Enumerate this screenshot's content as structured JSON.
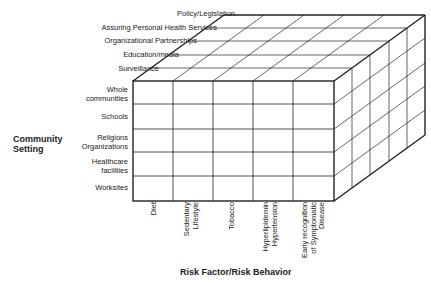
{
  "diagram": {
    "depth_axis": {
      "items": [
        "Policy/Legislation",
        "Assuring Personal Health Services",
        "Organizational Partnerships",
        "Education/media",
        "Surveillance"
      ]
    },
    "vertical_axis": {
      "title_line1": "Community",
      "title_line2": "Setting",
      "items": [
        {
          "line1": "Whole",
          "line2": "communities"
        },
        {
          "line1": "Schools",
          "line2": ""
        },
        {
          "line1": "Religions",
          "line2": "Organizations"
        },
        {
          "line1": "Healthcare",
          "line2": "facilities"
        },
        {
          "line1": "Worksites",
          "line2": ""
        }
      ]
    },
    "horizontal_axis": {
      "title": "Risk Factor/Risk Behavior",
      "items": [
        {
          "lines": [
            "Diet"
          ]
        },
        {
          "lines": [
            "Sedentary",
            "Lifestyle"
          ]
        },
        {
          "lines": [
            "Tobacco"
          ]
        },
        {
          "lines": [
            "Hyperlipidemin",
            "Hypertension"
          ]
        },
        {
          "lines": [
            "Early recognition",
            "of Symptomatic",
            "Disease"
          ]
        }
      ]
    },
    "colors": {
      "line": "#222222",
      "background": "#ffffff"
    }
  }
}
